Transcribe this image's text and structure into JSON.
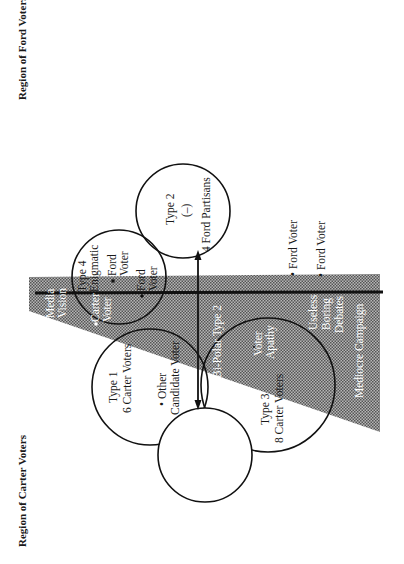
{
  "diagram": {
    "type": "venn-style voter typology diagram (page rotated 90°)",
    "regions": {
      "ford": "Region of Ford Voters",
      "carter": "Region of Carter Voters"
    },
    "shaded_area": {
      "label_top": "Media",
      "label_bottom": "Vision",
      "pattern_color": "#8a8a8a"
    },
    "circles": {
      "type2_minus": {
        "title": "Type 2",
        "sign": "(–)",
        "count": "4 Ford Partisans"
      },
      "type4": {
        "title": "Type 4",
        "subtitle": "Enigmatic",
        "point1_a": "Ford",
        "point1_b": "Voter",
        "point2_a": "Ford",
        "point2_b": "Voter",
        "carter_a": "Carter",
        "carter_b": "Voter"
      },
      "type1": {
        "title": "Type 1",
        "count": "6 Carter Voters"
      },
      "type2_plus": {
        "title": "Type 2",
        "sign": "(+)",
        "count": "5 Carter Partisans"
      },
      "type3": {
        "title": "Type 3",
        "count": "8 Carter Voters",
        "apathy_a": "Voter",
        "apathy_b": "Apathy"
      }
    },
    "other_candidate": {
      "a": "• Other",
      "b": "Candidate Voter"
    },
    "axis_label": "Bi-Polar Type 2",
    "outside_points": [
      "• Ford Voter",
      "• Ford Voter"
    ],
    "campaign_labels": {
      "useless": "Useless",
      "boring": "Boring",
      "debates": "Debates",
      "mediocre": "Mediocre Campaign"
    }
  }
}
